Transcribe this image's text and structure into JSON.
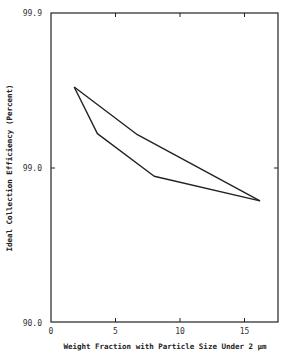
{
  "chart_data": {
    "type": "line",
    "title": "",
    "xlabel": "Weight Fraction with Particle Size Under 2 μm",
    "ylabel": "Ideal Collection Efficiency (Percent)",
    "xlim": [
      0,
      17.5
    ],
    "ylim": [
      90.0,
      99.9
    ],
    "yscale": "log-penetration",
    "x_ticks": [
      0,
      5,
      10,
      15
    ],
    "x_tick_labels": [
      "0",
      "5",
      "10",
      "15"
    ],
    "y_ticks": [
      99.9,
      99.0,
      90.0
    ],
    "y_tick_labels": [
      "99.9",
      "99.0",
      "90.0"
    ],
    "grid": false,
    "legend": null,
    "series": [
      {
        "name": "upper bound",
        "x": [
          1.8,
          6.7,
          16.2
        ],
        "y": [
          99.7,
          99.39,
          98.37
        ]
      },
      {
        "name": "lower bound",
        "x": [
          1.8,
          3.6,
          8.0,
          16.2
        ],
        "y": [
          99.7,
          99.4,
          98.87,
          98.37
        ]
      }
    ]
  },
  "layout": {
    "plot_left": 51,
    "plot_right": 278,
    "plot_top": 13,
    "plot_bottom": 322,
    "px_per_x_unit": 12.9,
    "px_per_decade": 155,
    "line_color": "#222222",
    "frame_color": "#222222"
  }
}
